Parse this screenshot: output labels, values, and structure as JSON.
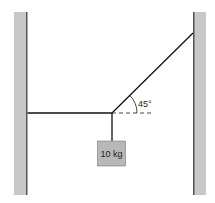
{
  "diagram": {
    "type": "statics-tension-diagram",
    "elements": {
      "left_wall": {
        "label": ""
      },
      "right_wall": {
        "label": ""
      },
      "horizontal_rope": {
        "label": ""
      },
      "angled_rope": {
        "label": ""
      },
      "vertical_rope": {
        "label": ""
      },
      "mass_block": {
        "label": "10 kg"
      },
      "reference_line": {
        "style": "dashed"
      },
      "angle": {
        "label": "45°",
        "value_degrees": 45
      }
    },
    "colors": {
      "wall_fill": "#c8c8c8",
      "wall_edge": "#555555",
      "block_fill": "#b8b8b8",
      "rope": "#111111"
    }
  }
}
